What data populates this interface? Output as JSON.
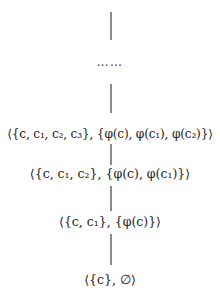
{
  "diagram": {
    "type": "vertical-chain",
    "ellipsis": "……",
    "nodes": [
      {
        "id": "n1",
        "label": "⟨{c, c₁, c₂, c₃}, {φ(c), φ(c₁), φ(c₂)}⟩"
      },
      {
        "id": "n2",
        "label": "⟨{c, c₁, c₂}, {φ(c), φ(c₁)}⟩"
      },
      {
        "id": "n3",
        "label": "⟨{c, c₁}, {φ(c)}⟩"
      },
      {
        "id": "n4",
        "label": "⟨{c}, ∅⟩"
      }
    ],
    "edges": [
      {
        "from": "top",
        "to": "ellipsis"
      },
      {
        "from": "ellipsis",
        "to": "n1"
      },
      {
        "from": "n1",
        "to": "n2"
      },
      {
        "from": "n2",
        "to": "n3"
      },
      {
        "from": "n3",
        "to": "n4"
      }
    ]
  }
}
